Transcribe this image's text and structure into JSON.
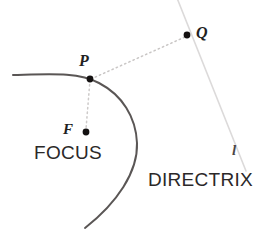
{
  "figure": {
    "type": "geometric-diagram",
    "width": 266,
    "height": 233,
    "background_color": "#ffffff"
  },
  "labels": {
    "point_p": "P",
    "point_q": "Q",
    "point_f": "F",
    "line_l": "l",
    "focus": "FOCUS",
    "directrix": "DIRECTRIX"
  },
  "colors": {
    "curve": "#5a5655",
    "directrix_line": "#dcdada",
    "dashed_guide": "#c9c6c5",
    "point_fill": "#141111",
    "text": "#231f1f"
  },
  "geometry": {
    "parabola": {
      "description": "leftward-opening parabola",
      "stroke_width": 2,
      "start": [
        13,
        75
      ],
      "vertex": [
        137,
        143
      ],
      "end": [
        85,
        228
      ],
      "path": "M 13 75 C 52 74 78 72 99 83 C 122 95 136 117 137 143 C 138 172 117 203 85 228"
    },
    "directrix": {
      "description": "slanted line l passing through Q",
      "stroke_width": 1.5,
      "start": [
        177,
        -2
      ],
      "end": [
        246,
        171
      ]
    },
    "segment_pq": {
      "description": "dashed segment from P to Q perpendicular to directrix",
      "start": [
        90,
        79
      ],
      "end": [
        186,
        36
      ]
    },
    "segment_pf": {
      "description": "dashed segment from P to focus F",
      "start": [
        90,
        79
      ],
      "end": [
        86,
        130
      ]
    },
    "points": [
      {
        "name": "P",
        "x": 90,
        "y": 79,
        "radius": 3.4
      },
      {
        "name": "Q",
        "x": 187,
        "y": 35,
        "radius": 3.4
      },
      {
        "name": "F",
        "x": 86,
        "y": 132,
        "radius": 3.4
      }
    ]
  }
}
